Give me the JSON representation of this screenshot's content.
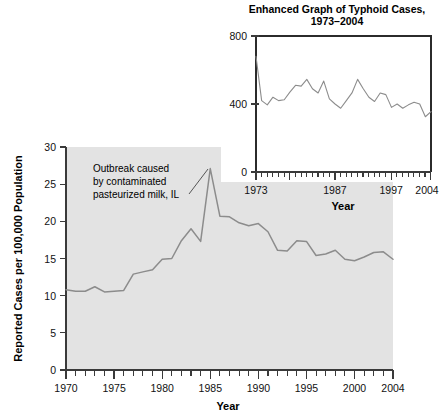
{
  "chart_data": [
    {
      "id": "main",
      "type": "line",
      "title": "",
      "xlabel": "Year",
      "ylabel": "Reported Cases per 100,000 Population",
      "xlim": [
        1970,
        2004
      ],
      "ylim": [
        0,
        30
      ],
      "yticks": [
        0,
        5,
        10,
        15,
        20,
        25,
        30
      ],
      "ytick_labels": [
        "0",
        "5",
        "10",
        "15",
        "20",
        "25",
        "30"
      ],
      "xticks_labeled": [
        1970,
        1975,
        1980,
        1985,
        1990,
        1995,
        2000,
        2004
      ],
      "xtick_labels": [
        "1970",
        "1975",
        "1980",
        "1985",
        "1990",
        "1995",
        "2000",
        "2004"
      ],
      "grid": false,
      "legend": "none",
      "line_color": "#8c8c8c",
      "plot_bg_color": "#e3e3e3",
      "x": [
        1970,
        1971,
        1972,
        1973,
        1974,
        1975,
        1976,
        1977,
        1978,
        1979,
        1980,
        1981,
        1982,
        1983,
        1984,
        1985,
        1986,
        1987,
        1988,
        1989,
        1990,
        1991,
        1992,
        1993,
        1994,
        1995,
        1996,
        1997,
        1998,
        1999,
        2000,
        2001,
        2002,
        2003,
        2004
      ],
      "values": [
        10.8,
        10.6,
        10.6,
        11.2,
        10.5,
        10.6,
        10.7,
        12.9,
        13.2,
        13.5,
        14.9,
        15.0,
        17.4,
        19.0,
        17.3,
        27.1,
        20.7,
        20.6,
        19.8,
        19.4,
        19.7,
        18.6,
        16.1,
        16.0,
        17.4,
        17.3,
        15.4,
        15.6,
        16.1,
        14.9,
        14.7,
        15.2,
        15.8,
        15.9,
        14.9
      ],
      "annotations": [
        {
          "text_lines": [
            "Outbreak caused",
            "by contaminated",
            "pasteurized milk, IL"
          ],
          "points_to_year": 1985,
          "points_to_value": 27.1
        }
      ]
    },
    {
      "id": "inset",
      "type": "line",
      "title": "Enhanced Graph of Typhoid Cases, 1973–2004",
      "title_line1": "Enhanced Graph of Typhoid Cases,",
      "title_line2": "1973–2004",
      "xlabel": "Year",
      "ylabel": "",
      "xlim": [
        1973,
        2004
      ],
      "ylim": [
        0,
        800
      ],
      "yticks": [
        0,
        400,
        800
      ],
      "ytick_labels": [
        "0",
        "400",
        "800"
      ],
      "xticks_labeled": [
        1973,
        1987,
        1997,
        2004
      ],
      "xtick_labels": [
        "1973",
        "1987",
        "1997",
        "2004"
      ],
      "grid": false,
      "legend": "none",
      "line_color": "#8c8c8c",
      "plot_bg_color": "#ffffff",
      "x": [
        1973,
        1974,
        1975,
        1976,
        1977,
        1978,
        1979,
        1980,
        1981,
        1982,
        1983,
        1984,
        1985,
        1986,
        1987,
        1988,
        1989,
        1990,
        1991,
        1992,
        1993,
        1994,
        1995,
        1996,
        1997,
        1998,
        1999,
        2000,
        2001,
        2002,
        2003,
        2004
      ],
      "values": [
        680,
        420,
        395,
        440,
        420,
        425,
        470,
        510,
        505,
        545,
        490,
        465,
        535,
        430,
        400,
        375,
        420,
        465,
        545,
        490,
        440,
        415,
        465,
        455,
        380,
        400,
        375,
        395,
        410,
        400,
        325,
        355
      ]
    }
  ],
  "main_chart": {
    "ylabel": "Reported Cases per 100,000 Population",
    "xlabel": "Year",
    "ytick_labels": [
      "0",
      "5",
      "10",
      "15",
      "20",
      "25",
      "30"
    ],
    "xtick_labels": [
      "1970",
      "1975",
      "1980",
      "1985",
      "1990",
      "1995",
      "2000",
      "2004"
    ],
    "annotation": {
      "line1": "Outbreak caused",
      "line2": "by contaminated",
      "line3": "pasteurized milk, IL"
    }
  },
  "inset_chart": {
    "title_line1": "Enhanced Graph of Typhoid Cases,",
    "title_line2": "1973–2004",
    "xlabel": "Year",
    "ytick_labels": [
      "0",
      "400",
      "800"
    ],
    "xtick_labels": [
      "1973",
      "1987",
      "1997",
      "2004"
    ]
  }
}
